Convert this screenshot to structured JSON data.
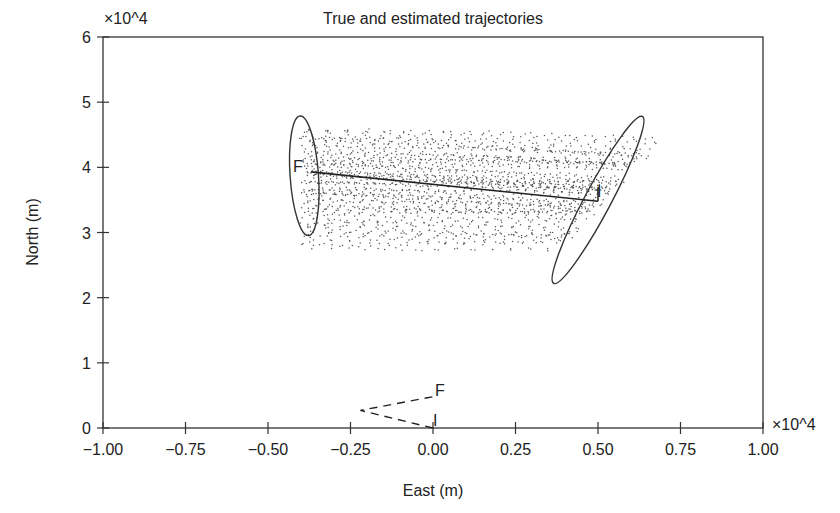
{
  "chart_data": {
    "type": "scatter",
    "title": "True and estimated trajectories",
    "xlabel": "East (m)",
    "ylabel": "North (m)",
    "x_multiplier": "×10^4",
    "y_multiplier": "×10^4",
    "xlim": [
      -1.0,
      1.0
    ],
    "ylim": [
      0,
      6
    ],
    "xticks": [
      "-1.00",
      "-0.75",
      "-0.50",
      "-0.25",
      "0.00",
      "0.25",
      "0.50",
      "0.75",
      "1.00"
    ],
    "xtick_values": [
      -1.0,
      -0.75,
      -0.5,
      -0.25,
      0.0,
      0.25,
      0.5,
      0.75,
      1.0
    ],
    "yticks": [
      "0",
      "1",
      "2",
      "3",
      "4",
      "5",
      "6"
    ],
    "ytick_values": [
      0,
      1,
      2,
      3,
      4,
      5,
      6
    ],
    "grid": false,
    "series": [
      {
        "name": "True target trajectory",
        "style": "solid line",
        "start_label": "I",
        "end_label": "F",
        "x": [
          0.5,
          -0.37
        ],
        "y": [
          3.48,
          3.93
        ]
      },
      {
        "name": "Sensor (observer) trajectory",
        "style": "dashed line",
        "start_label": "I",
        "end_label": "F",
        "x": [
          0.0,
          -0.22,
          0.0
        ],
        "y": [
          0.0,
          0.27,
          0.48
        ]
      },
      {
        "name": "Estimated trajectories (particle cloud)",
        "style": "dots",
        "start_region": {
          "x": [
            -0.4,
            -0.35
          ],
          "y": [
            2.75,
            4.6
          ]
        },
        "end_region": {
          "x": [
            0.3,
            0.66
          ],
          "y": [
            2.8,
            4.4
          ]
        }
      }
    ],
    "ellipses": [
      {
        "name": "Final-position uncertainty ellipse",
        "cx": -0.39,
        "cy": 3.87,
        "rx": 0.043,
        "ry": 0.92,
        "angle_deg": -4
      },
      {
        "name": "Initial-position uncertainty ellipse",
        "cx": 0.5,
        "cy": 3.5,
        "rx": 0.04,
        "ry": 1.45,
        "angle_deg": 28
      }
    ],
    "annotations": [
      {
        "text": "F",
        "at": "end of true trajectory"
      },
      {
        "text": "I",
        "at": "start of true trajectory"
      },
      {
        "text": "F",
        "at": "end of sensor trajectory"
      },
      {
        "text": "I",
        "at": "start of sensor trajectory"
      }
    ]
  },
  "labels": {
    "title": "True and estimated trajectories",
    "xlabel": "East (m)",
    "ylabel": "North (m)",
    "x_multiplier": "×10^4",
    "y_multiplier": "×10^4",
    "target_final": "F",
    "target_initial": "I",
    "sensor_final": "F",
    "sensor_initial": "I"
  }
}
